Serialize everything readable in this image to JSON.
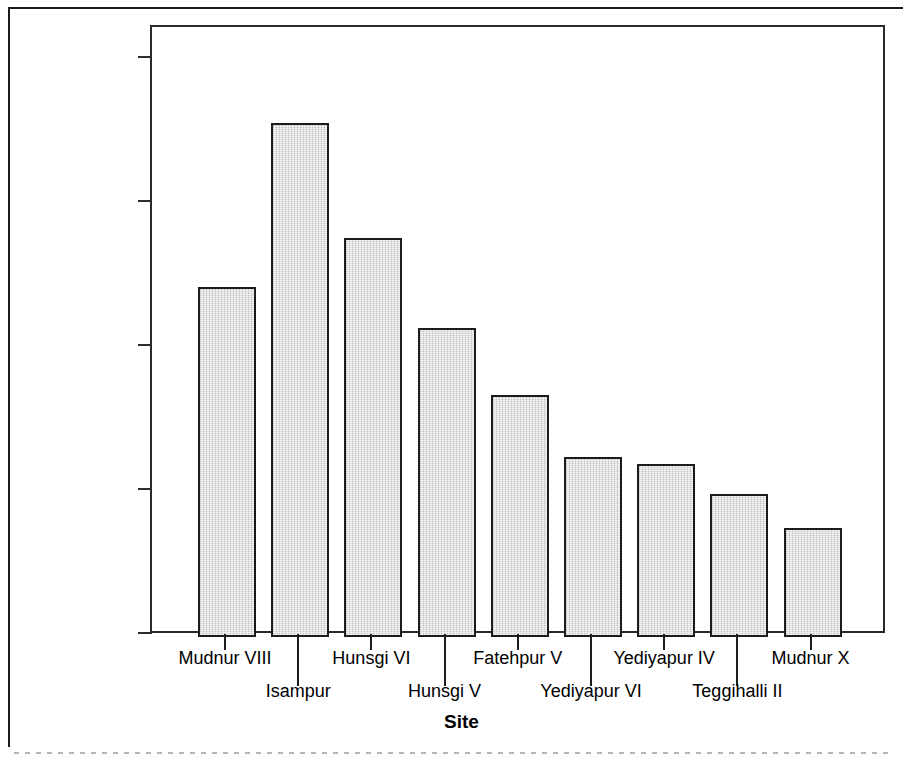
{
  "figure": {
    "background_color": "#ffffff",
    "frame_color": "#2a2a2a",
    "bar_fill_color": "#d6d6d6",
    "bar_border_color": "#1c1c1c"
  },
  "chart_data": {
    "type": "bar",
    "title": "",
    "xlabel": "Site",
    "ylabel": "Mean Flake Scar Area in square mm",
    "categories": [
      "Mudnur VIII",
      "Isampur",
      "Hunsgi VI",
      "Hunsgi V",
      "Fatehpur V",
      "Yediyapur VI",
      "Yediyapur IV",
      "Teggihalli II",
      "Mudnur X"
    ],
    "values": [
      1207,
      1778,
      1380,
      1065,
      832,
      617,
      595,
      488,
      372
    ],
    "ylim": [
      0,
      2100
    ],
    "ytick_values": [
      0,
      500,
      1000,
      1500,
      2000
    ],
    "ytick_labels": [
      "0.00",
      "500.00",
      "1000.00",
      "1500.00",
      "2000.00"
    ],
    "grid": false,
    "legend": "none",
    "label_rows": [
      0,
      1,
      0,
      1,
      0,
      1,
      0,
      1,
      0
    ]
  }
}
